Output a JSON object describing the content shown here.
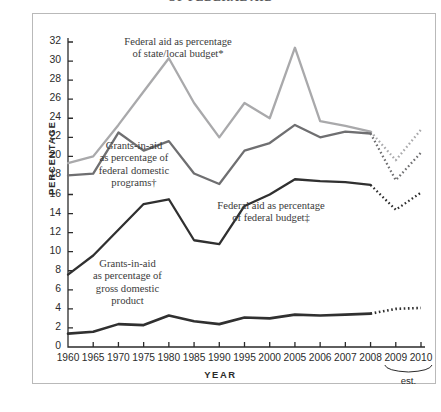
{
  "figure": {
    "title_partial": "OF FEDERAL AID",
    "axis_y_title": "PERCENTAGE",
    "axis_x_title": "YEAR",
    "est_label": "est."
  },
  "colors": {
    "state_local": "#a9a9ab",
    "federal_domestic": "#6f6f71",
    "gdp": "#303030",
    "frame": "#b9b9b9",
    "text": "#2b2b2b"
  },
  "labels": {
    "state_local": "Federal aid as percentage\nof state/local budget*",
    "federal_domestic": "Grants-in-aid\nas percentage of\nfederal domestic\nprograms†",
    "federal_budget": "Federal aid as percentage\nof federal budget‡",
    "gdp": "Grants-in-aid\nas percentage of\ngross domestic\nproduct"
  },
  "chart_data": {
    "type": "line",
    "title": "OF FEDERAL AID",
    "xlabel": "YEAR",
    "ylabel": "PERCENTAGE",
    "ylim": [
      0,
      33
    ],
    "yticks": [
      0,
      2,
      4,
      6,
      8,
      10,
      12,
      14,
      16,
      18,
      20,
      22,
      24,
      26,
      28,
      30,
      32
    ],
    "grid": false,
    "legend_position": "inline-annotations",
    "categories": [
      "1960",
      "1965",
      "1970",
      "1975",
      "1980",
      "1985",
      "1990",
      "1995",
      "2000",
      "2005",
      "2006",
      "2007",
      "2008",
      "2009",
      "2010"
    ],
    "estimated_categories": [
      "2009",
      "2010"
    ],
    "annotations": [
      "Federal aid as percentage of state/local budget*",
      "Grants-in-aid as percentage of federal domestic programs†",
      "Federal aid as percentage of federal budget‡",
      "Grants-in-aid as percentage of gross domestic product",
      "est."
    ],
    "series": [
      {
        "name": "Federal aid as percentage of state/local budget*",
        "color": "#a9a9ab",
        "values": [
          19.3,
          20.0,
          23.3,
          26.8,
          30.3,
          25.6,
          22.0,
          25.6,
          24.0,
          31.4,
          23.7,
          23.2,
          22.6,
          19.6,
          22.8
        ],
        "estimated_from": "2008"
      },
      {
        "name": "Grants-in-aid as percentage of federal domestic programs†",
        "color": "#6f6f71",
        "values": [
          18.0,
          18.2,
          22.5,
          20.6,
          21.6,
          18.2,
          17.1,
          20.6,
          21.4,
          23.3,
          22.0,
          22.6,
          22.4,
          17.5,
          20.4
        ],
        "estimated_from": "2008"
      },
      {
        "name": "Federal aid as percentage of federal budget‡",
        "color": "#303030",
        "values": [
          7.6,
          9.6,
          12.3,
          15.0,
          15.5,
          11.2,
          10.8,
          14.8,
          16.0,
          17.6,
          17.4,
          17.3,
          17.0,
          14.4,
          16.2
        ],
        "estimated_from": "2008"
      },
      {
        "name": "Grants-in-aid as percentage of gross domestic product",
        "color": "#303030",
        "values": [
          1.4,
          1.6,
          2.4,
          2.3,
          3.3,
          2.7,
          2.4,
          3.1,
          3.0,
          3.4,
          3.3,
          3.4,
          3.5,
          4.0,
          4.1
        ],
        "estimated_from": "2008"
      }
    ]
  }
}
